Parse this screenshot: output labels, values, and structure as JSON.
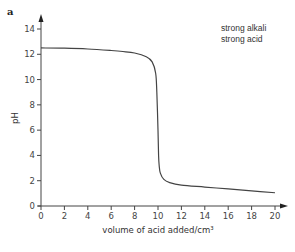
{
  "panel": {
    "label": "a"
  },
  "chart_data": {
    "type": "line",
    "title": "",
    "xlabel": "volume of acid added/cm³",
    "ylabel": "pH",
    "xlim": [
      0,
      20
    ],
    "ylim": [
      0,
      14
    ],
    "xticks": [
      0,
      2,
      4,
      6,
      8,
      10,
      12,
      14,
      16,
      18,
      20
    ],
    "yticks": [
      0,
      2,
      4,
      6,
      8,
      10,
      12,
      14
    ],
    "grid": false,
    "annotations": [
      "strong alkali",
      "strong acid"
    ],
    "series": [
      {
        "name": "strong alkali / strong acid titration",
        "x": [
          0,
          2,
          4,
          6,
          7,
          8,
          9,
          9.5,
          9.8,
          9.9,
          10.0,
          10.05,
          10.1,
          10.2,
          10.5,
          11,
          12,
          14,
          16,
          18,
          20
        ],
        "y": [
          12.5,
          12.48,
          12.42,
          12.3,
          12.22,
          12.1,
          11.8,
          11.4,
          10.5,
          9.0,
          6.0,
          4.0,
          3.2,
          2.6,
          2.1,
          1.85,
          1.65,
          1.5,
          1.35,
          1.2,
          1.05
        ]
      }
    ]
  }
}
